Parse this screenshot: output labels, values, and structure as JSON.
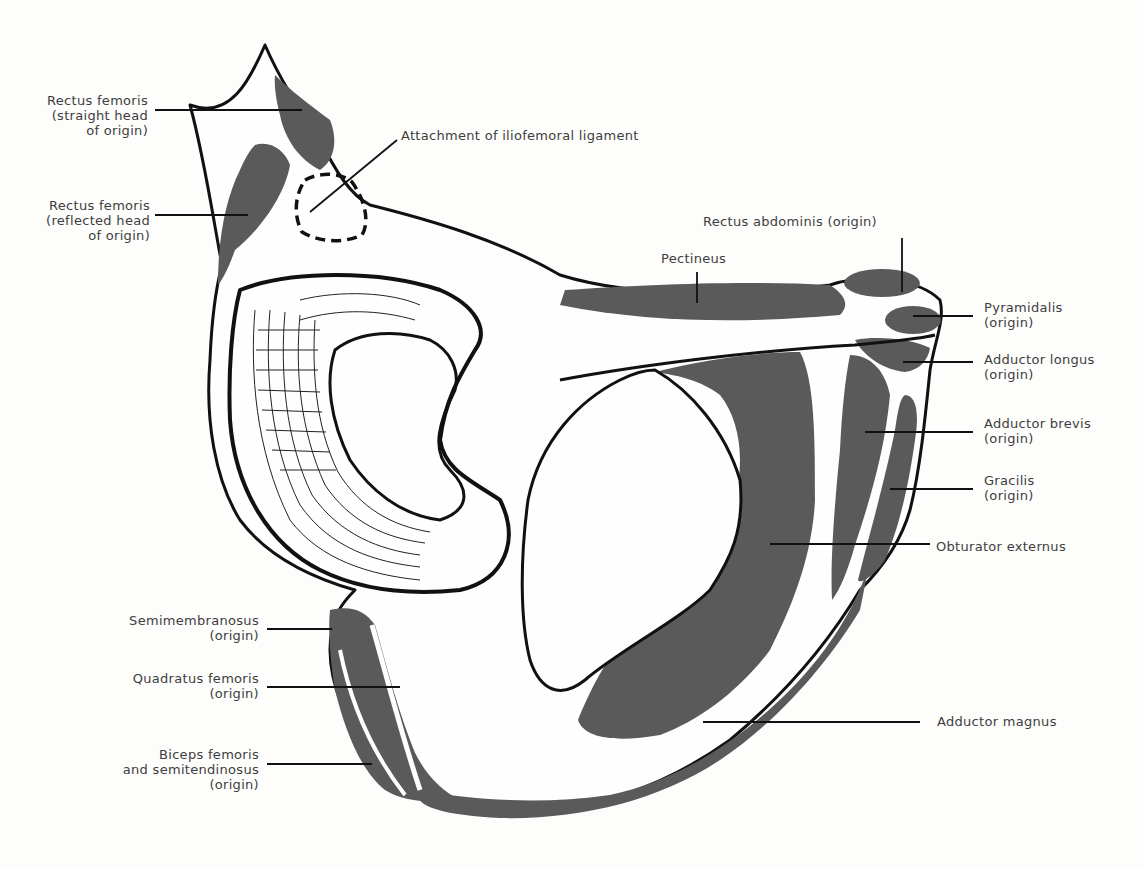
{
  "figure": {
    "colors": {
      "muscle_fill": "#5a5a5a",
      "bone_fill": "#fefefe",
      "outline": "#111111",
      "label_text": "#3e3e3e"
    }
  },
  "labels": {
    "rectus_femoris_straight": "Rectus femoris\n(straight head\nof origin)",
    "rectus_femoris_reflected": "Rectus femoris\n(reflected head\nof origin)",
    "iliofemoral": "Attachment of iliofemoral ligament",
    "rectus_abdominis": "Rectus abdominis (origin)",
    "pectineus": "Pectineus",
    "pyramidalis": "Pyramidalis\n(origin)",
    "adductor_longus": "Adductor longus\n(origin)",
    "adductor_brevis": "Adductor brevis\n(origin)",
    "gracilis": "Gracilis\n(origin)",
    "obturator_externus": "Obturator externus",
    "adductor_magnus": "Adductor magnus",
    "semimembranosus": "Semimembranosus\n(origin)",
    "quadratus_femoris": "Quadratus femoris\n(origin)",
    "biceps_femoris": "Biceps femoris\nand semitendinosus\n(origin)"
  }
}
